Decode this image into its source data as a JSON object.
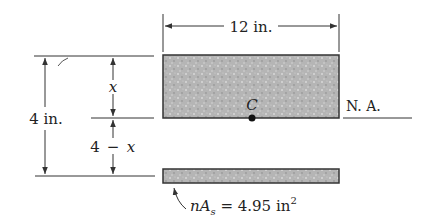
{
  "diagram": {
    "width_label": "12 in.",
    "height_label": "4 in.",
    "top_dim_label": "x",
    "bottom_dim_label_num": "4",
    "bottom_dim_label_op": "−",
    "bottom_dim_label_var": "x",
    "centroid_label": "C",
    "neutral_axis_label": "N. A.",
    "steel_label_n": "n",
    "steel_label_A": "A",
    "steel_label_sub": "s",
    "steel_label_eq": " = 4.95 in",
    "steel_label_sup": "2"
  },
  "colors": {
    "line": "#333333",
    "concrete_fill": "#b8b8b8",
    "steel_fill": "#c4c4c4",
    "centroid_dot": "#111111"
  }
}
